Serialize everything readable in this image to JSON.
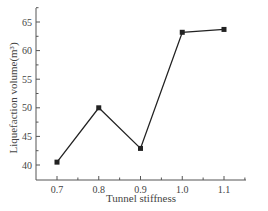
{
  "chart_data": {
    "type": "line",
    "title": "",
    "xlabel": "Tunnel stiffness",
    "ylabel": "Liquefaction volume(m³)",
    "x": [
      0.7,
      0.8,
      0.9,
      1.0,
      1.1
    ],
    "series": [
      {
        "name": "Liquefaction volume",
        "values": [
          40.5,
          50.0,
          42.9,
          63.2,
          63.7
        ],
        "marker": "square",
        "color": "#222222"
      }
    ],
    "xticks": [
      "0.7",
      "0.8",
      "0.9",
      "1.0",
      "1.1"
    ],
    "yticks": [
      "40",
      "45",
      "50",
      "55",
      "60",
      "65"
    ],
    "xlim": [
      0.65,
      1.15
    ],
    "ylim": [
      37.5,
      67.5
    ],
    "grid": false,
    "legend": null
  }
}
